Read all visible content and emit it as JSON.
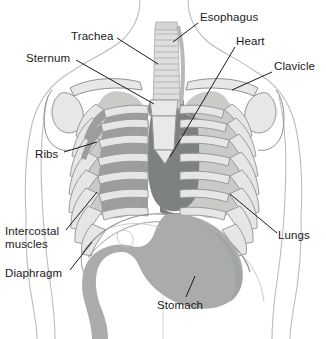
{
  "figure": {
    "type": "labeled-anatomical-diagram",
    "view": "anterior chest and upper abdomen",
    "background_color": "#ffffff",
    "text_color": "#1a1a1a",
    "leader_line_color": "#1a1a1a",
    "palette": {
      "body_outline": "#b9bcc0",
      "bone_fill": "#e3e4e3",
      "bone_outline": "#8d9195",
      "lung_fill": "#c8cac6",
      "heart_fill": "#7d8080",
      "trachea_fill": "#dedfdc",
      "trachea_ring": "#a9acaa",
      "intercostal_fill": "#9fa2a0",
      "stomach_fill": "#a9aca8",
      "diaphragm_outline": "#8d9195"
    }
  },
  "labels": [
    {
      "id": "esophagus",
      "text": "Esophagus",
      "x": 200,
      "y": 11,
      "align": "left",
      "leader": {
        "x1": 198,
        "y1": 23,
        "x2": 173,
        "y2": 42
      }
    },
    {
      "id": "trachea",
      "text": "Trachea",
      "x": 71,
      "y": 30,
      "align": "left",
      "leader": {
        "x1": 117,
        "y1": 38,
        "x2": 158,
        "y2": 64
      }
    },
    {
      "id": "heart",
      "text": "Heart",
      "x": 236,
      "y": 35,
      "align": "left",
      "leader": {
        "x1": 235,
        "y1": 47,
        "x2": 170,
        "y2": 157
      }
    },
    {
      "id": "sternum",
      "text": "Sternum",
      "x": 26,
      "y": 52,
      "align": "left",
      "leader": {
        "x1": 76,
        "y1": 60,
        "x2": 154,
        "y2": 104
      }
    },
    {
      "id": "clavicle",
      "text": "Clavicle",
      "x": 274,
      "y": 60,
      "align": "left",
      "leader": {
        "x1": 272,
        "y1": 72,
        "x2": 232,
        "y2": 90
      }
    },
    {
      "id": "ribs",
      "text": "Ribs",
      "x": 35,
      "y": 148,
      "align": "left",
      "leader": {
        "x1": 64,
        "y1": 152,
        "x2": 97,
        "y2": 142
      }
    },
    {
      "id": "lungs",
      "text": "Lungs",
      "x": 278,
      "y": 229,
      "align": "left",
      "leader": {
        "x1": 277,
        "y1": 233,
        "x2": 230,
        "y2": 194
      }
    },
    {
      "id": "intercostal-muscles",
      "text": "Intercostal\nmuscles",
      "x": 5,
      "y": 225,
      "align": "left",
      "leader": {
        "x1": 66,
        "y1": 230,
        "x2": 97,
        "y2": 192
      }
    },
    {
      "id": "diaphragm",
      "text": "Diaphragm",
      "x": 5,
      "y": 267,
      "align": "left",
      "leader": {
        "x1": 70,
        "y1": 270,
        "x2": 92,
        "y2": 242
      }
    },
    {
      "id": "stomach",
      "text": "Stomach",
      "x": 157,
      "y": 299,
      "align": "left",
      "leader": {
        "x1": 186,
        "y1": 297,
        "x2": 195,
        "y2": 276
      }
    }
  ],
  "structures": [
    {
      "id": "trachea",
      "name": "Trachea",
      "description": "Vertical cartilage-ringed tube in upper center"
    },
    {
      "id": "esophagus",
      "name": "Esophagus",
      "description": "Tube behind trachea at top center"
    },
    {
      "id": "heart",
      "name": "Heart",
      "description": "Dark gray central mass behind sternum"
    },
    {
      "id": "lungs",
      "name": "Lungs",
      "description": "Paired light gray fields either side of heart"
    },
    {
      "id": "clavicle",
      "name": "Clavicle",
      "description": "Collar bones across upper shoulders"
    },
    {
      "id": "sternum",
      "name": "Sternum",
      "description": "Breast bone in center of rib cage"
    },
    {
      "id": "ribs",
      "name": "Ribs",
      "description": "Curved bony arcs forming thoracic cage"
    },
    {
      "id": "intercostal-muscles",
      "name": "Intercostal muscles",
      "description": "Dark bands between the ribs on the left"
    },
    {
      "id": "diaphragm",
      "name": "Diaphragm",
      "description": "Dome-shaped muscle under the lungs"
    },
    {
      "id": "stomach",
      "name": "Stomach",
      "description": "Large gray organ below the diaphragm"
    }
  ]
}
